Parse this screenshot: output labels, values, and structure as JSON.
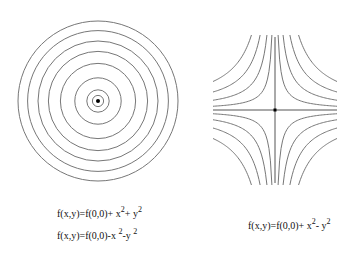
{
  "colors": {
    "contour": "#777777",
    "axis": "#555555",
    "point": "#000000",
    "text": "#111111"
  },
  "left_diagram": {
    "description": "concentric circular level curves around an extremum",
    "contour_levels": [
      0.07,
      0.14,
      0.29,
      0.47,
      0.62,
      0.75,
      0.88,
      1.0
    ],
    "has_center_point": true
  },
  "right_diagram": {
    "description": "hyperbolic level curves around a saddle point with axes",
    "contour_levels": [
      0.05,
      0.13,
      0.24,
      0.38
    ],
    "has_center_point": true,
    "has_axes": true
  },
  "formulas": [
    {
      "base": "f(x,y)=f(0,0)+ x",
      "sup1": "2",
      "mid": "+ y",
      "sup2": "2"
    },
    {
      "base": "f(x,y)=f(0,0)-x ",
      "sup1": "2",
      "mid": "-y ",
      "sup2": "2"
    },
    {
      "base": "f(x,y)=f(0,0)+ x",
      "sup1": "2",
      "mid": "- y",
      "sup2": "2"
    }
  ]
}
